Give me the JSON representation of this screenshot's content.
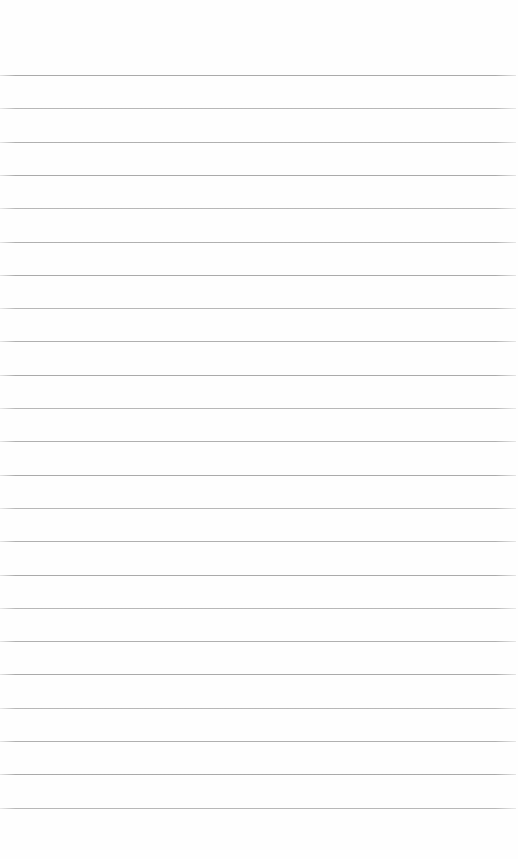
{
  "page": {
    "kind": "blank-ruled-paper",
    "background_color": "#fefefe",
    "line_color": "#969696",
    "line_count": 23,
    "first_line_top_px": 75,
    "line_spacing_px": 33.3,
    "line_left_px": 0,
    "line_width_px": 516,
    "line_thickness_px": 1
  }
}
